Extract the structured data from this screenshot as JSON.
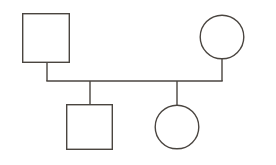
{
  "diagram": {
    "type": "pedigree",
    "generations": 2,
    "background_color": "#ffffff",
    "stroke_color": "#4a4540",
    "fill_color": "#ffffff",
    "stroke_width": 1.4,
    "canvas": {
      "width": 276,
      "height": 165
    }
  },
  "nodes": [
    {
      "id": "father",
      "label": "",
      "symbol": "square",
      "sex": "male",
      "generation": 1,
      "role": "parent",
      "affected": false,
      "x": 22,
      "y": 13,
      "width": 48,
      "height": 50,
      "center_x": 46,
      "center_y": 38
    },
    {
      "id": "mother",
      "label": "",
      "symbol": "circle",
      "sex": "female",
      "generation": 1,
      "role": "parent",
      "affected": false,
      "center_x": 222,
      "center_y": 37,
      "radius": 22.5
    },
    {
      "id": "son",
      "label": "",
      "symbol": "square",
      "sex": "male",
      "generation": 2,
      "role": "child",
      "affected": false,
      "x": 66,
      "y": 104,
      "width": 47,
      "height": 46,
      "center_x": 89.5,
      "center_y": 127
    },
    {
      "id": "daughter",
      "label": "",
      "symbol": "circle",
      "sex": "female",
      "generation": 2,
      "role": "child",
      "affected": false,
      "center_x": 177,
      "center_y": 127,
      "radius": 22.5
    }
  ],
  "edges": [
    {
      "id": "father-drop",
      "type": "vertical",
      "from": "father",
      "to": "mating-line",
      "x1": 47,
      "y1": 63,
      "x2": 47,
      "y2": 81
    },
    {
      "id": "mating-line",
      "type": "horizontal",
      "from": "father",
      "to": "mother",
      "x1": 47,
      "y1": 81,
      "x2": 222,
      "y2": 81
    },
    {
      "id": "mother-drop",
      "type": "vertical",
      "from": "mother",
      "to": "mating-line",
      "x1": 222,
      "y1": 59,
      "x2": 222,
      "y2": 81
    },
    {
      "id": "son-drop",
      "type": "vertical",
      "from": "mating-line",
      "to": "son",
      "x1": 90,
      "y1": 81,
      "x2": 90,
      "y2": 104
    },
    {
      "id": "daughter-drop",
      "type": "vertical",
      "from": "mating-line",
      "to": "daughter",
      "x1": 177,
      "y1": 81,
      "x2": 177,
      "y2": 105
    }
  ]
}
